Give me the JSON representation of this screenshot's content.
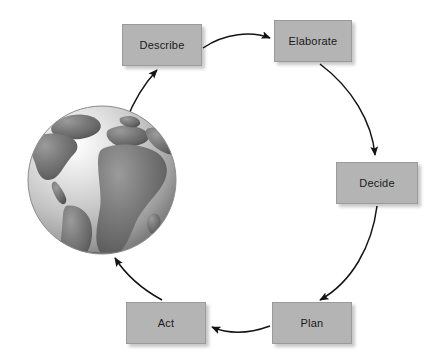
{
  "diagram": {
    "type": "cyclic-process-diagram",
    "colors": {
      "box_fill": "#b4b4b4",
      "box_border": "#9a9a9a",
      "text": "#1a1a1a",
      "arrow": "#1a1a1a",
      "background": "#ffffff",
      "globe_ocean_light": "#f0f0f0",
      "globe_ocean_mid": "#c8c8c8",
      "globe_land": "#6e6e6e",
      "globe_land_dark": "#585858"
    },
    "nodes": [
      {
        "id": "describe",
        "label": "Describe"
      },
      {
        "id": "elaborate",
        "label": "Elaborate"
      },
      {
        "id": "decide",
        "label": "Decide"
      },
      {
        "id": "plan",
        "label": "Plan"
      },
      {
        "id": "act",
        "label": "Act"
      },
      {
        "id": "globe",
        "label": ""
      }
    ],
    "edges": [
      {
        "from": "globe",
        "to": "describe",
        "style": "curved-arrow"
      },
      {
        "from": "describe",
        "to": "elaborate",
        "style": "curved-arrow"
      },
      {
        "from": "elaborate",
        "to": "decide",
        "style": "curved-arrow"
      },
      {
        "from": "decide",
        "to": "plan",
        "style": "curved-arrow"
      },
      {
        "from": "plan",
        "to": "act",
        "style": "curved-arrow"
      },
      {
        "from": "act",
        "to": "globe",
        "style": "curved-arrow"
      }
    ],
    "center_graphic": {
      "name": "globe-earth",
      "description": "Grayscale globe showing the Americas, Europe and Africa"
    }
  }
}
